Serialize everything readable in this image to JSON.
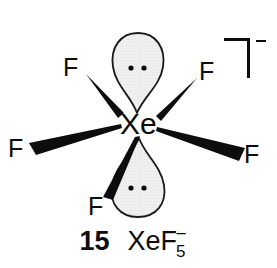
{
  "figure": {
    "kind": "chemical-structure-diagram",
    "molecule": "XeF5-",
    "geometry": "pentagonal planar with two axial lone pairs",
    "background_color": "#ffffff",
    "ink_color": "#0d0d0d",
    "lobe_fill_color": "#efefef",
    "lobe_stroke_color": "#1a1a1a"
  },
  "central_atom": {
    "label": "Xe",
    "x": 137,
    "y": 125
  },
  "ligands": [
    {
      "name": "fluorine-top-left",
      "label": "F",
      "x": 66,
      "y": 56,
      "bond": "wedge"
    },
    {
      "name": "fluorine-top-right",
      "label": "F",
      "x": 200,
      "y": 60,
      "bond": "wedge"
    },
    {
      "name": "fluorine-left",
      "label": "F",
      "x": 9,
      "y": 137,
      "bond": "wedge"
    },
    {
      "name": "fluorine-right",
      "label": "F",
      "x": 245,
      "y": 143,
      "bond": "wedge"
    },
    {
      "name": "fluorine-bottom-left",
      "label": "F",
      "x": 90,
      "y": 195,
      "bond": "wedge"
    }
  ],
  "lone_pairs": [
    {
      "name": "lone-pair-top",
      "dots": 2,
      "position": "above-central-atom"
    },
    {
      "name": "lone-pair-bottom",
      "dots": 2,
      "position": "below-central-atom"
    }
  ],
  "charge_bracket": {
    "name": "charge-bracket",
    "charge_symbol": "−",
    "shape": "top-right-corner"
  },
  "caption": {
    "number": "15",
    "formula_element": "XeF",
    "formula_subscript": "5",
    "formula_charge": "−",
    "full": "15  XeF5⁻"
  }
}
